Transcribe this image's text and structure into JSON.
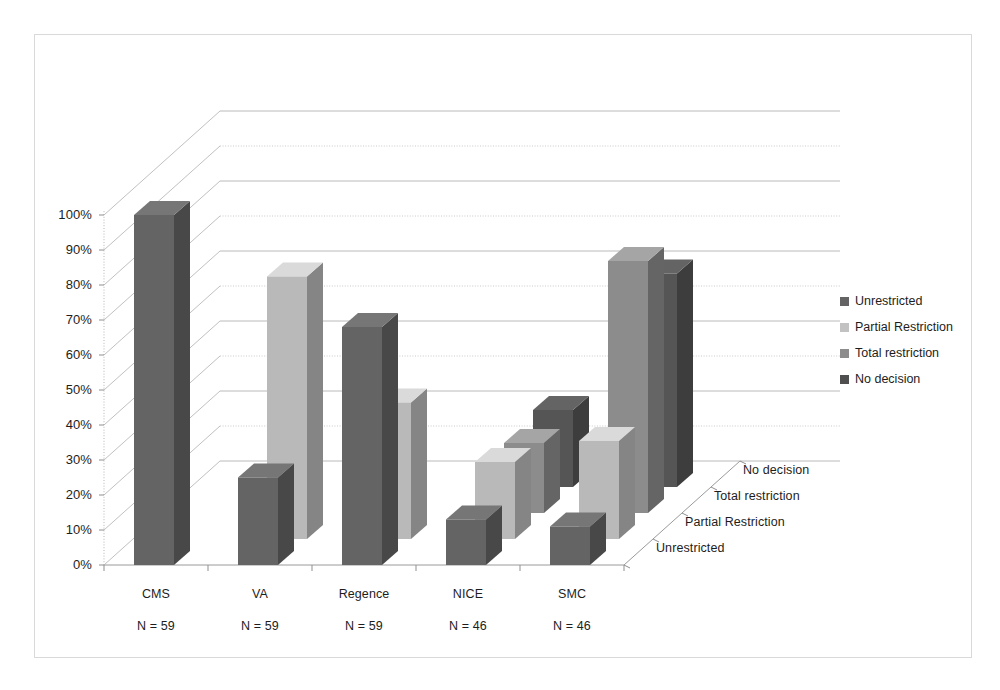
{
  "chart_data": {
    "type": "bar",
    "subtype": "3d-grouped-column",
    "title": "",
    "xlabel": "",
    "ylabel": "",
    "ylim": [
      0,
      100
    ],
    "grid": true,
    "legend_position": "right",
    "categories": [
      "CMS",
      "VA",
      "Regence",
      "NICE",
      "SMC"
    ],
    "category_sublabels": [
      "N = 59",
      "N = 59",
      "N = 59",
      "N = 46",
      "N = 46"
    ],
    "depth_axis_labels": [
      "Unrestricted",
      "Partial Restriction",
      "Total restriction",
      "No decision"
    ],
    "ytick_labels": [
      "0%",
      "10%",
      "20%",
      "30%",
      "40%",
      "50%",
      "60%",
      "70%",
      "80%",
      "90%",
      "100%"
    ],
    "ytick_values": [
      0,
      10,
      20,
      30,
      40,
      50,
      60,
      70,
      80,
      90,
      100
    ],
    "series": [
      {
        "name": "Unrestricted",
        "color": "#646464",
        "values": [
          100,
          25,
          68,
          13,
          11
        ]
      },
      {
        "name": "Partial Restriction",
        "color": "#b9b9b9",
        "values": [
          0,
          75,
          39,
          22,
          28
        ]
      },
      {
        "name": "Total restriction",
        "color": "#8c8c8c",
        "values": [
          0,
          0,
          0,
          20,
          72
        ]
      },
      {
        "name": "No decision",
        "color": "#555555",
        "values": [
          0,
          0,
          0,
          22,
          61
        ]
      }
    ]
  },
  "legend": {
    "items": [
      {
        "label": "Unrestricted",
        "color": "#646464"
      },
      {
        "label": "Partial Restriction",
        "color": "#c2c2c2"
      },
      {
        "label": "Total restriction",
        "color": "#8c8c8c"
      },
      {
        "label": "No decision",
        "color": "#4f4f4f"
      }
    ]
  },
  "axes": {
    "y": {
      "ticks": [
        "0%",
        "10%",
        "20%",
        "30%",
        "40%",
        "50%",
        "60%",
        "70%",
        "80%",
        "90%",
        "100%"
      ]
    },
    "x": {
      "ticks": [
        {
          "label": "CMS",
          "sub": "N = 59"
        },
        {
          "label": "VA",
          "sub": "N = 59"
        },
        {
          "label": "Regence",
          "sub": "N = 59"
        },
        {
          "label": "NICE",
          "sub": "N = 46"
        },
        {
          "label": "SMC",
          "sub": "N = 46"
        }
      ]
    },
    "z": {
      "ticks": [
        "Unrestricted",
        "Partial Restriction",
        "Total restriction",
        "No decision"
      ]
    }
  }
}
